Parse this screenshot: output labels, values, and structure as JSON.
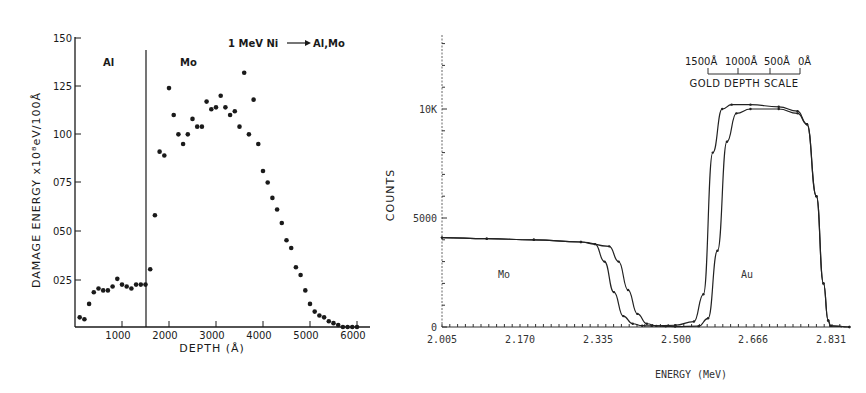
{
  "chart_data": [
    {
      "type": "scatter",
      "title": "1 MeV Ni → Al,Mo",
      "xlabel": "DEPTH (Å)",
      "ylabel": "DAMAGE ENERGY x10^8 eV/100Å",
      "xlim": [
        0,
        6200
      ],
      "ylim": [
        0,
        150
      ],
      "xticks": [
        1000,
        2000,
        3000,
        4000,
        5000,
        6000
      ],
      "xtick_labels": [
        "1000",
        "2000",
        "3000",
        "4000",
        "5000",
        "6000"
      ],
      "yticks": [
        25,
        50,
        75,
        100,
        125,
        150
      ],
      "ytick_labels": [
        "025",
        "050",
        "075",
        "100",
        "125",
        "150"
      ],
      "grid": false,
      "annotations": [
        {
          "text": "Al",
          "x": 600,
          "y": 138
        },
        {
          "text": "Mo",
          "x": 2200,
          "y": 138
        },
        {
          "text": "Al/Mo interface",
          "x": 1500,
          "type": "vline"
        }
      ],
      "series": [
        {
          "name": "damage energy",
          "x": [
            100,
            200,
            300,
            400,
            500,
            600,
            700,
            800,
            900,
            1000,
            1100,
            1200,
            1300,
            1400,
            1500,
            1600,
            1700,
            1800,
            1900,
            2000,
            2100,
            2200,
            2300,
            2400,
            2500,
            2600,
            2700,
            2800,
            2900,
            3000,
            3100,
            3200,
            3300,
            3400,
            3500,
            3600,
            3700,
            3800,
            3900,
            4000,
            4100,
            4200,
            4300,
            4400,
            4500,
            4600,
            4700,
            4800,
            4900,
            5000,
            5100,
            5200,
            5300,
            5400,
            5500,
            5600,
            5700,
            5800,
            5900,
            6000
          ],
          "y": [
            5,
            4,
            12,
            18,
            20,
            19,
            19,
            21,
            25,
            22,
            21,
            20,
            22,
            22,
            22,
            30,
            58,
            91,
            89,
            124,
            110,
            100,
            95,
            100,
            108,
            104,
            104,
            117,
            113,
            114,
            120,
            114,
            110,
            112,
            104,
            132,
            100,
            118,
            95,
            81,
            75,
            67,
            61,
            54,
            45,
            41,
            31,
            27,
            19,
            12,
            8,
            6,
            5,
            3,
            2,
            1,
            0,
            0,
            0,
            0
          ]
        }
      ]
    },
    {
      "type": "line",
      "title": "",
      "xlabel": "ENERGY (MeV)",
      "ylabel": "COUNTS",
      "xlim": [
        2.005,
        2.87
      ],
      "ylim": [
        0,
        13000
      ],
      "xticks": [
        2.005,
        2.17,
        2.335,
        2.5,
        2.666,
        2.831
      ],
      "xtick_labels": [
        "2.005",
        "2.170",
        "2.335",
        "2.500",
        "2.666",
        "2.831"
      ],
      "yticks": [
        0,
        5000,
        10000
      ],
      "ytick_labels": [
        "0",
        "5000",
        "10K"
      ],
      "grid": false,
      "annotations": [
        {
          "text": "Mo",
          "x": 2.14,
          "y": 2400
        },
        {
          "text": "Au",
          "x": 2.66,
          "y": 2400
        },
        {
          "text": "GOLD DEPTH SCALE",
          "scale_labels": [
            "1500Å",
            "1000Å",
            "500Å",
            "0Å"
          ]
        }
      ],
      "series": [
        {
          "name": "spectrum A (fit + data)",
          "x": [
            2.005,
            2.1,
            2.2,
            2.3,
            2.33,
            2.35,
            2.37,
            2.39,
            2.41,
            2.43,
            2.45,
            2.5,
            2.54,
            2.56,
            2.58,
            2.6,
            2.62,
            2.66,
            2.72,
            2.76,
            2.78,
            2.8,
            2.815,
            2.825,
            2.83,
            2.87
          ],
          "y": [
            4100,
            4050,
            4000,
            3900,
            3800,
            3000,
            1600,
            500,
            150,
            60,
            50,
            80,
            250,
            1500,
            8000,
            10000,
            10200,
            10200,
            10100,
            9900,
            9300,
            6000,
            2000,
            300,
            50,
            0
          ]
        },
        {
          "name": "spectrum B (fit + data)",
          "x": [
            2.005,
            2.1,
            2.2,
            2.3,
            2.36,
            2.38,
            2.4,
            2.42,
            2.44,
            2.46,
            2.48,
            2.5,
            2.55,
            2.57,
            2.59,
            2.61,
            2.63,
            2.66,
            2.72,
            2.76,
            2.78,
            2.8,
            2.815,
            2.825,
            2.83,
            2.87
          ],
          "y": [
            4100,
            4050,
            4000,
            3900,
            3700,
            3000,
            1700,
            600,
            150,
            50,
            30,
            20,
            40,
            400,
            3500,
            8500,
            9800,
            10000,
            10000,
            9800,
            9300,
            6000,
            2000,
            300,
            50,
            0
          ]
        }
      ]
    }
  ],
  "left_chart": {
    "title": "1 MeV Ni",
    "title_target": "Al,Mo",
    "ylabel": "DAMAGE  ENERGY  x10⁸eV/100Å",
    "xlabel": "DEPTH (Å)",
    "region_al": "Al",
    "region_mo": "Mo",
    "yticks": [
      "025",
      "050",
      "075",
      "100",
      "125",
      "150"
    ],
    "xticks": [
      "1000",
      "2000",
      "3000",
      "4000",
      "5000",
      "6000"
    ]
  },
  "right_chart": {
    "ylabel": "COUNTS",
    "xlabel": "ENERGY (MeV)",
    "region_mo": "Mo",
    "region_au": "Au",
    "yticks": [
      "0",
      "5000",
      "10K"
    ],
    "xticks": [
      "2.005",
      "2.170",
      "2.335",
      "2.500",
      "2.666",
      "2.831"
    ],
    "depth_scale": {
      "title": "GOLD  DEPTH  SCALE",
      "labels": [
        "1500Å",
        "1000Å",
        "500Å",
        "0Å"
      ]
    }
  }
}
